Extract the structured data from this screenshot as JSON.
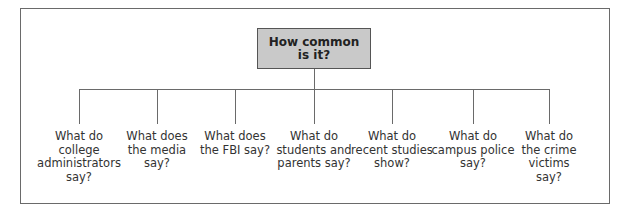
{
  "diagram": {
    "root": {
      "label": "How common\nis it?"
    },
    "branches": [
      {
        "label": "What do\ncollege\nadministrators\nsay?"
      },
      {
        "label": "What does\nthe media\nsay?"
      },
      {
        "label": "What does\nthe FBI say?"
      },
      {
        "label": "What do\nstudents and\nparents say?"
      },
      {
        "label": "What do\nrecent studies\nshow?"
      },
      {
        "label": "What do\ncampus police\nsay?"
      },
      {
        "label": "What do\nthe crime\nvictims\nsay?"
      }
    ],
    "colors": {
      "root_fill": "#c9c9c9",
      "lines": "#6a6a6a"
    }
  }
}
